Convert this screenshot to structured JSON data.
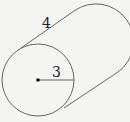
{
  "diagram": {
    "type": "cylinder",
    "labels": {
      "height": "4",
      "radius": "3"
    },
    "colors": {
      "background": "#f4f4f2",
      "stroke": "#555555",
      "text": "#222222"
    }
  }
}
